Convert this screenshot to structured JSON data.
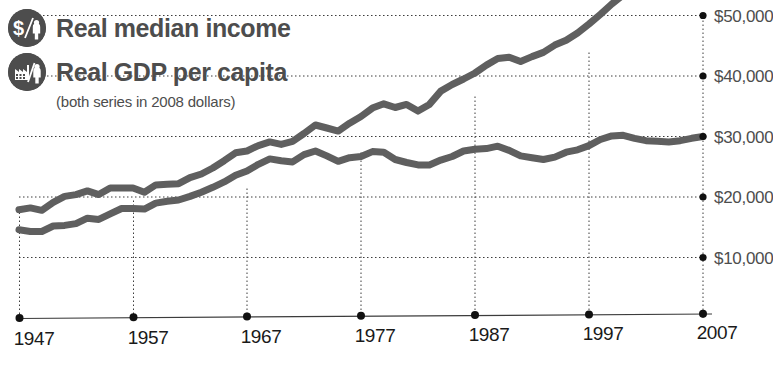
{
  "legend": {
    "items": [
      {
        "label": "Real median income",
        "icon": "dollar-person-icon"
      },
      {
        "label": "Real GDP per capita",
        "icon": "factory-person-icon"
      }
    ],
    "subtitle": "(both series in 2008 dollars)"
  },
  "colors": {
    "line": "#5f5f5f",
    "text": "#4d4d4d",
    "axis": "#3c3c3c",
    "icon_background": "#4d4d4d"
  },
  "chart_data": {
    "type": "line",
    "title": "",
    "subtitle": "(both series in 2008 dollars)",
    "xlabel": "",
    "ylabel": "",
    "xlim": [
      1947,
      2007
    ],
    "ylim": [
      0,
      50000
    ],
    "grid": true,
    "legend_position": "top-left",
    "x_ticks": [
      1947,
      1957,
      1967,
      1977,
      1987,
      1997,
      2007
    ],
    "x_tick_labels": [
      "1947",
      "1957",
      "1967",
      "1977",
      "1987",
      "1997",
      "2007"
    ],
    "y_ticks": [
      10000,
      20000,
      30000,
      40000,
      50000
    ],
    "y_tick_labels": [
      "$10,000",
      "$20,000",
      "$30,000",
      "$40,000",
      "$50,000"
    ],
    "x": [
      1947,
      1948,
      1949,
      1950,
      1951,
      1952,
      1953,
      1954,
      1955,
      1956,
      1957,
      1958,
      1959,
      1960,
      1961,
      1962,
      1963,
      1964,
      1965,
      1966,
      1967,
      1968,
      1969,
      1970,
      1971,
      1972,
      1973,
      1974,
      1975,
      1976,
      1977,
      1978,
      1979,
      1980,
      1981,
      1982,
      1983,
      1984,
      1985,
      1986,
      1987,
      1988,
      1989,
      1990,
      1991,
      1992,
      1993,
      1994,
      1995,
      1996,
      1997,
      1998,
      1999,
      2000,
      2001,
      2002,
      2003,
      2004,
      2005,
      2006,
      2007
    ],
    "series": [
      {
        "name": "Real median income",
        "values": [
          14600,
          14300,
          14300,
          15200,
          15300,
          15600,
          16500,
          16300,
          17200,
          18100,
          18100,
          18000,
          19000,
          19300,
          19500,
          20100,
          20800,
          21600,
          22500,
          23600,
          24300,
          25400,
          26300,
          26000,
          25800,
          27000,
          27600,
          26800,
          25900,
          26500,
          26700,
          27500,
          27400,
          26200,
          25700,
          25300,
          25300,
          26100,
          26700,
          27600,
          27900,
          28000,
          28400,
          27700,
          26800,
          26500,
          26200,
          26600,
          27400,
          27800,
          28500,
          29500,
          30100,
          30200,
          29700,
          29300,
          29200,
          29100,
          29300,
          29700,
          30000
        ]
      },
      {
        "name": "Real GDP per capita",
        "values": [
          17900,
          18200,
          17800,
          19100,
          20100,
          20400,
          21000,
          20400,
          21500,
          21500,
          21500,
          20800,
          22000,
          22100,
          22200,
          23200,
          23800,
          24800,
          26000,
          27300,
          27600,
          28500,
          29100,
          28700,
          29200,
          30500,
          31900,
          31400,
          30900,
          32200,
          33300,
          34700,
          35400,
          34800,
          35300,
          34200,
          35300,
          37500,
          38600,
          39500,
          40500,
          41800,
          42900,
          43100,
          42400,
          43200,
          43900,
          45100,
          45900,
          47100,
          48600,
          50200,
          51900,
          53400,
          53200,
          53500,
          54600,
          56200,
          57500,
          58400,
          58900
        ]
      }
    ],
    "series_display_note": "Both series plotted on the same $0-$50,000 axis; median income lower, GDP per capita higher after approx. 1963 crossing."
  }
}
